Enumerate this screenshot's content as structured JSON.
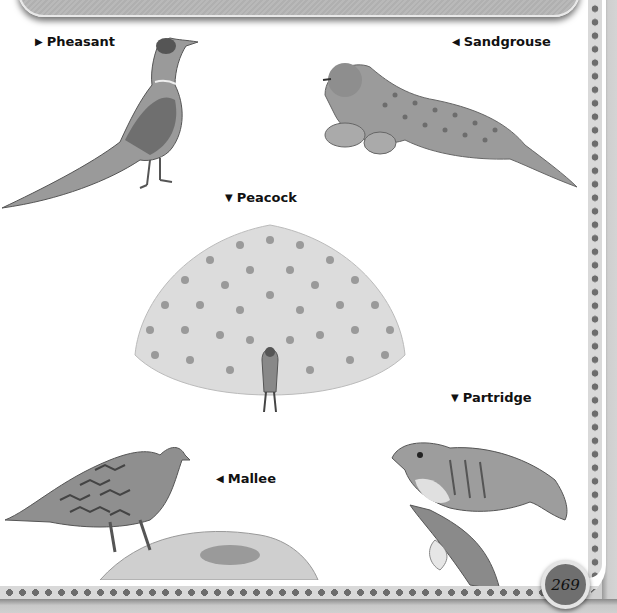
{
  "page": {
    "page_number": "269",
    "colors": {
      "background": "#ffffff",
      "banner": "#b5b5b5",
      "border_dots": "#6d6d6d",
      "badge": "#6f6f6f"
    }
  },
  "birds": [
    {
      "name": "Pheasant",
      "arrow": "▶",
      "arrow-icon": "arrow-right-icon"
    },
    {
      "name": "Sandgrouse",
      "arrow": "◀",
      "arrow-icon": "arrow-left-icon"
    },
    {
      "name": "Peacock",
      "arrow": "▼",
      "arrow-icon": "arrow-down-icon"
    },
    {
      "name": "Partridge",
      "arrow": "▼",
      "arrow-icon": "arrow-down-icon"
    },
    {
      "name": "Mallee",
      "arrow": "◀",
      "arrow-icon": "arrow-left-icon"
    }
  ]
}
